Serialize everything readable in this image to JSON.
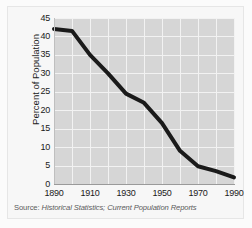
{
  "chart_data": {
    "type": "line",
    "title": "",
    "xlabel": "",
    "ylabel": "Percent of Population",
    "xlim": [
      1890,
      1990
    ],
    "ylim": [
      0,
      45
    ],
    "grid": true,
    "legend": "none",
    "x": [
      1890,
      1900,
      1910,
      1920,
      1930,
      1940,
      1950,
      1960,
      1970,
      1980,
      1990
    ],
    "values": [
      42,
      41.5,
      35,
      30,
      24.5,
      22,
      16.5,
      9,
      4.8,
      3.5,
      1.8
    ],
    "series": [
      {
        "name": "Percent of Population",
        "values": [
          42,
          41.5,
          35,
          30,
          24.5,
          22,
          16.5,
          9,
          4.8,
          3.5,
          1.8
        ],
        "color": "#1a1a1a"
      }
    ],
    "ytick_labels": [
      "45",
      "40",
      "35",
      "30",
      "25",
      "20",
      "15",
      "10",
      "5",
      "0"
    ],
    "ytick_values": [
      45,
      40,
      35,
      30,
      25,
      20,
      15,
      10,
      5,
      0
    ],
    "xtick_labels": [
      "1890",
      "1910",
      "1930",
      "1950",
      "1970",
      "1990"
    ],
    "xtick_values": [
      1890,
      1910,
      1930,
      1950,
      1970,
      1990
    ],
    "gridline_x_values": [
      1890,
      1900,
      1910,
      1920,
      1930,
      1940,
      1950,
      1960,
      1970,
      1980,
      1990
    ],
    "plot_background": "#d6d6d6",
    "gridline_color": "#f2f2f2",
    "line_color": "#1a1a1a",
    "line_width": 4
  },
  "source": {
    "label": "Source:",
    "body": "Historical Statistics; Current Population Reports",
    "full": "Source: Historical Statistics; Current Population Reports"
  }
}
